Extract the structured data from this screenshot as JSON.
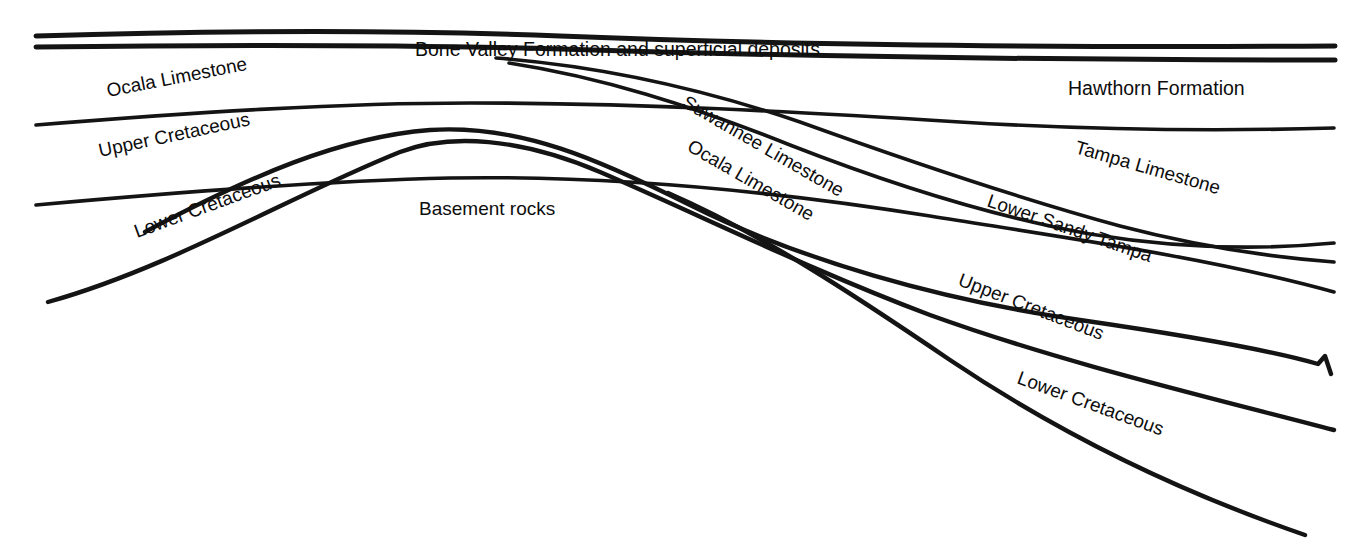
{
  "figure": {
    "kind": "geologic-cross-section",
    "background_color": "#ffffff",
    "line_color": "#141414",
    "text_color": "#0d0d0d",
    "width": 1363,
    "height": 551
  },
  "labels": {
    "bone_valley": "Bone Valley Formation and superficial deposits",
    "ocala_left": "Ocala Limestone",
    "upper_cretaceous_left": "Upper Cretaceous",
    "lower_cretaceous_left": "Lower Cretaceous",
    "basement": "Basement rocks",
    "suwannee": "Suwannee Limestone",
    "ocala_center": "Ocala Limestone",
    "hawthorn": "Hawthorn Formation",
    "tampa": "Tampa Limestone",
    "lower_sandy_tampa": "Lower Sandy Tampa",
    "upper_cretaceous_right": "Upper Cretaceous",
    "lower_cretaceous_right": "Lower Cretaceous"
  },
  "chart_data": {
    "type": "line",
    "xlabel": "",
    "ylabel": "",
    "grid": false,
    "legend": "none",
    "xlim": [
      0,
      1363
    ],
    "ylim": [
      0,
      551
    ],
    "note": "Stratigraphic boundary horizons drawn as smooth curves; an anticlinal arch of basement rocks rises at center-left and units thicken and dip to the right (southeast).",
    "series": [
      {
        "name": "Top of section (land surface)",
        "path": "M 36,36 C 200,31 380,29 560,36 C 760,44 1000,48 1335,46"
      },
      {
        "name": "Base of Bone Valley Formation and superficial deposits",
        "path": "M 36,47 C 200,45 380,44 560,49 C 780,56 1050,60 1335,60"
      },
      {
        "name": "Top of Suwannee Limestone (pinches out westward)",
        "path": "M 496,58 C 600,66 700,88 800,122 C 900,158 1010,196 1120,226 C 1200,247 1270,257 1334,262"
      },
      {
        "name": "Top of Hawthorn Formation / Tampa Limestone boundary",
        "path": "M 36,125 C 200,112 340,103 470,103 C 640,103 800,112 960,122 C 1110,131 1230,131 1334,128"
      },
      {
        "name": "Top of Ocala Limestone",
        "path": "M 509,63 C 600,77 690,105 790,145 C 890,184 990,216 1090,234 C 1180,249 1260,250 1334,243"
      },
      {
        "name": "Base of Tampa Limestone / top of Lower Sandy Tampa",
        "path": "M 36,205 C 180,192 320,181 450,178 C 620,175 780,192 930,216 C 1080,240 1210,258 1334,292"
      },
      {
        "name": "Base of Lower Sandy Tampa / top of Upper Cretaceous",
        "path": "M 48,302 C 170,268 290,196 400,152 C 450,133 520,138 600,172 C 700,215 810,270 930,315 C 1060,362 1200,395 1334,430"
      },
      {
        "name": "Top of Upper Cretaceous (arch crest, with notch at right)",
        "path": "M 145,232 C 250,176 340,137 430,130 C 520,124 600,160 690,205 C 800,260 940,300 1080,320 C 1190,336 1270,350 1318,364 L 1325,356 L 1331,374"
      },
      {
        "name": "Top of Lower Cretaceous",
        "path": "M 668,193 C 760,233 850,292 950,360 C 1060,434 1180,492 1305,535"
      }
    ],
    "annotations": [
      {
        "text": "Bone Valley Formation and superficial deposits",
        "x": 415,
        "y": 56,
        "rotation": 0
      },
      {
        "text": "Ocala Limestone",
        "x": 108,
        "y": 97,
        "rotation": -11
      },
      {
        "text": "Upper Cretaceous",
        "x": 100,
        "y": 157,
        "rotation": -12
      },
      {
        "text": "Lower Cretaceous",
        "x": 137,
        "y": 238,
        "rotation": -20
      },
      {
        "text": "Basement rocks",
        "x": 419,
        "y": 215,
        "rotation": 0
      },
      {
        "text": "Suwannee Limestone",
        "x": 681,
        "y": 106,
        "rotation": 30
      },
      {
        "text": "Ocala Limestone",
        "x": 686,
        "y": 150,
        "rotation": 30
      },
      {
        "text": "Hawthorn Formation",
        "x": 1068,
        "y": 95,
        "rotation": 0
      },
      {
        "text": "Tampa Limestone",
        "x": 1074,
        "y": 153,
        "rotation": 16
      },
      {
        "text": "Lower Sandy Tampa",
        "x": 986,
        "y": 206,
        "rotation": 19
      },
      {
        "text": "Upper Cretaceous",
        "x": 957,
        "y": 285,
        "rotation": 21
      },
      {
        "text": "Lower Cretaceous",
        "x": 1016,
        "y": 383,
        "rotation": 20
      }
    ]
  }
}
